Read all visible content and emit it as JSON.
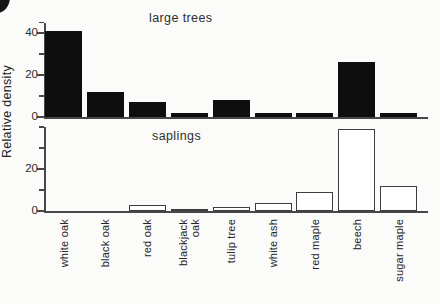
{
  "figure": {
    "ylabel": "Relative density",
    "background": "#fbfbfa",
    "bar_fill_color": "#0e0e0e",
    "bar_outline_color": "#3d3d3d",
    "axis_color": "#474747"
  },
  "chart_data": [
    {
      "type": "bar",
      "title": "large trees",
      "style": "filled-black",
      "ylabel": "Relative density",
      "categories": [
        "white oak",
        "black oak",
        "red oak",
        "blackjack\noak",
        "tulip tree",
        "white ash",
        "red maple",
        "beech",
        "sugar maple"
      ],
      "values": [
        41,
        12,
        7,
        2,
        8,
        2,
        2,
        26,
        2
      ],
      "ylim": [
        0,
        45
      ],
      "yticks_labeled": [
        0,
        20,
        40
      ],
      "yticks_minor": [
        10,
        30,
        45
      ],
      "grid": false,
      "legend": "none"
    },
    {
      "type": "bar",
      "title": "saplings",
      "style": "outline-white",
      "ylabel": "Relative density",
      "categories": [
        "white oak",
        "black oak",
        "red oak",
        "blackjack\noak",
        "tulip tree",
        "white ash",
        "red maple",
        "beech",
        "sugar maple"
      ],
      "values": [
        0,
        0,
        3,
        1,
        2,
        4,
        9,
        39,
        12
      ],
      "ylim": [
        0,
        40
      ],
      "yticks_labeled": [
        0,
        20
      ],
      "yticks_minor": [
        10,
        30,
        40
      ],
      "grid": false,
      "legend": "none"
    }
  ]
}
